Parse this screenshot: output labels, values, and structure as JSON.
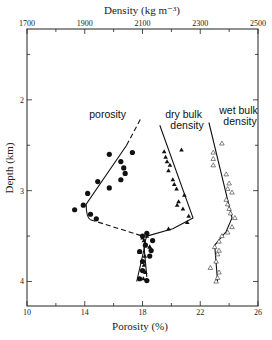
{
  "chart_data": {
    "type": "scatter",
    "title": "",
    "top_axis": {
      "label": "Density (kg m⁻³)",
      "range": [
        1700,
        2500
      ],
      "ticks": [
        1700,
        1900,
        2100,
        2300,
        2500
      ],
      "minor_ticks": [
        1800,
        2000,
        2200,
        2400
      ]
    },
    "bottom_axis": {
      "label": "Porosity (%)",
      "range": [
        10,
        26
      ],
      "ticks": [
        10,
        14,
        18,
        22,
        26
      ],
      "minor_ticks": [
        12,
        16,
        20,
        24
      ]
    },
    "left_axis": {
      "label": "Depth (km)",
      "range": [
        1.22,
        4.27
      ],
      "ticks": [
        2,
        3,
        4
      ],
      "minor_ticks": [
        1.5,
        2.5,
        3.5
      ],
      "inverted": true
    },
    "series": [
      {
        "name": "porosity",
        "label": "porosity",
        "marker": "filled-circle",
        "axis": "bottom",
        "points": [
          [
            15.7,
            2.6
          ],
          [
            17.3,
            2.58
          ],
          [
            16.5,
            2.68
          ],
          [
            16.7,
            2.75
          ],
          [
            16.8,
            2.81
          ],
          [
            16.5,
            2.88
          ],
          [
            14.9,
            2.9
          ],
          [
            15.7,
            2.97
          ],
          [
            14.2,
            3.03
          ],
          [
            13.9,
            3.16
          ],
          [
            13.3,
            3.21
          ],
          [
            14.4,
            3.26
          ],
          [
            14.8,
            3.31
          ],
          [
            18.0,
            3.5
          ],
          [
            18.3,
            3.47
          ],
          [
            18.7,
            3.55
          ],
          [
            18.2,
            3.6
          ],
          [
            17.8,
            3.67
          ],
          [
            18.6,
            3.66
          ],
          [
            18.0,
            3.78
          ],
          [
            18.5,
            3.72
          ],
          [
            18.0,
            3.88
          ],
          [
            17.8,
            3.97
          ],
          [
            18.3,
            3.99
          ]
        ],
        "trend_solid": [
          [
            16.9,
            2.5
          ],
          [
            14.1,
            3.2
          ],
          [
            14.4,
            3.32
          ]
        ],
        "trend_dashed_upper": [
          [
            16.9,
            2.5
          ],
          [
            17.9,
            2.2
          ]
        ],
        "trend_dashed_mid": [
          [
            14.4,
            3.32
          ],
          [
            18.0,
            3.5
          ]
        ],
        "trend_solid_lower": [
          [
            18.0,
            3.5
          ],
          [
            18.2,
            3.58
          ],
          [
            17.6,
            4.0
          ]
        ]
      },
      {
        "name": "dry bulk density",
        "label": "dry bulk density",
        "marker": "filled-triangle",
        "axis": "top",
        "points": [
          [
            2175,
            2.57
          ],
          [
            2235,
            2.55
          ],
          [
            2180,
            2.63
          ],
          [
            2185,
            2.68
          ],
          [
            2195,
            2.72
          ],
          [
            2190,
            2.78
          ],
          [
            2205,
            2.88
          ],
          [
            2210,
            2.93
          ],
          [
            2218,
            2.98
          ],
          [
            2245,
            3.05
          ],
          [
            2225,
            3.12
          ],
          [
            2220,
            3.16
          ],
          [
            2240,
            3.2
          ],
          [
            2260,
            3.28
          ],
          [
            2255,
            3.35
          ],
          [
            2190,
            3.42
          ],
          [
            2115,
            3.5
          ],
          [
            2100,
            3.52
          ],
          [
            2105,
            3.55
          ],
          [
            2125,
            3.62
          ],
          [
            2090,
            3.68
          ],
          [
            2108,
            3.72
          ],
          [
            2105,
            3.82
          ],
          [
            2110,
            3.9
          ],
          [
            2103,
            3.97
          ],
          [
            2125,
            3.62
          ]
        ],
        "trend": [
          [
            2160,
            2.28
          ],
          [
            2275,
            3.3
          ],
          [
            2205,
            3.42
          ],
          [
            2115,
            3.5
          ],
          [
            2105,
            3.6
          ],
          [
            2115,
            3.95
          ]
        ]
      },
      {
        "name": "wet bulk density",
        "label": "wet bulk density",
        "marker": "open-triangle",
        "axis": "top",
        "points": [
          [
            2375,
            2.48
          ],
          [
            2345,
            2.58
          ],
          [
            2345,
            2.65
          ],
          [
            2345,
            2.72
          ],
          [
            2390,
            2.82
          ],
          [
            2400,
            2.92
          ],
          [
            2395,
            2.98
          ],
          [
            2410,
            3.02
          ],
          [
            2390,
            3.1
          ],
          [
            2395,
            3.15
          ],
          [
            2400,
            3.2
          ],
          [
            2405,
            3.25
          ],
          [
            2420,
            3.3
          ],
          [
            2410,
            3.4
          ],
          [
            2395,
            3.46
          ],
          [
            2375,
            3.5
          ],
          [
            2365,
            3.56
          ],
          [
            2350,
            3.62
          ],
          [
            2365,
            3.66
          ],
          [
            2360,
            3.7
          ],
          [
            2355,
            3.78
          ],
          [
            2335,
            3.85
          ],
          [
            2365,
            3.9
          ],
          [
            2360,
            3.96
          ],
          [
            2355,
            4.0
          ]
        ],
        "trend": [
          [
            2330,
            2.25
          ],
          [
            2410,
            3.3
          ],
          [
            2390,
            3.45
          ],
          [
            2350,
            3.6
          ],
          [
            2360,
            4.0
          ]
        ]
      }
    ],
    "grid": false,
    "legend": "inline labels above curves"
  }
}
